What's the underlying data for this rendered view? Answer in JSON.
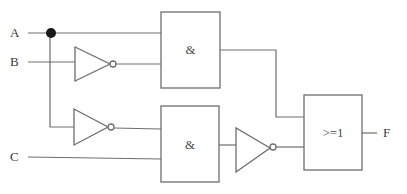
{
  "diagram": {
    "type": "logic-circuit",
    "inputs": [
      {
        "id": "A",
        "label": "A"
      },
      {
        "id": "B",
        "label": "B"
      },
      {
        "id": "C",
        "label": "C"
      }
    ],
    "outputs": [
      {
        "id": "F",
        "label": "F"
      }
    ],
    "gates": [
      {
        "id": "not1",
        "type": "NOT",
        "input": "B"
      },
      {
        "id": "not2",
        "type": "NOT",
        "input": "A"
      },
      {
        "id": "and1",
        "type": "AND",
        "label": "&",
        "inputs": [
          "A",
          "not1"
        ]
      },
      {
        "id": "and2",
        "type": "AND",
        "label": "&",
        "inputs": [
          "not2",
          "C"
        ]
      },
      {
        "id": "not3",
        "type": "NOT",
        "input": "and2"
      },
      {
        "id": "or1",
        "type": "OR",
        "label": ">=1",
        "inputs": [
          "and1",
          "not3"
        ],
        "output": "F"
      }
    ],
    "colors": {
      "line": "#6e6e6e",
      "text": "#3a3a3a",
      "junction": "#1a1a1a",
      "background": "#ffffff"
    }
  }
}
